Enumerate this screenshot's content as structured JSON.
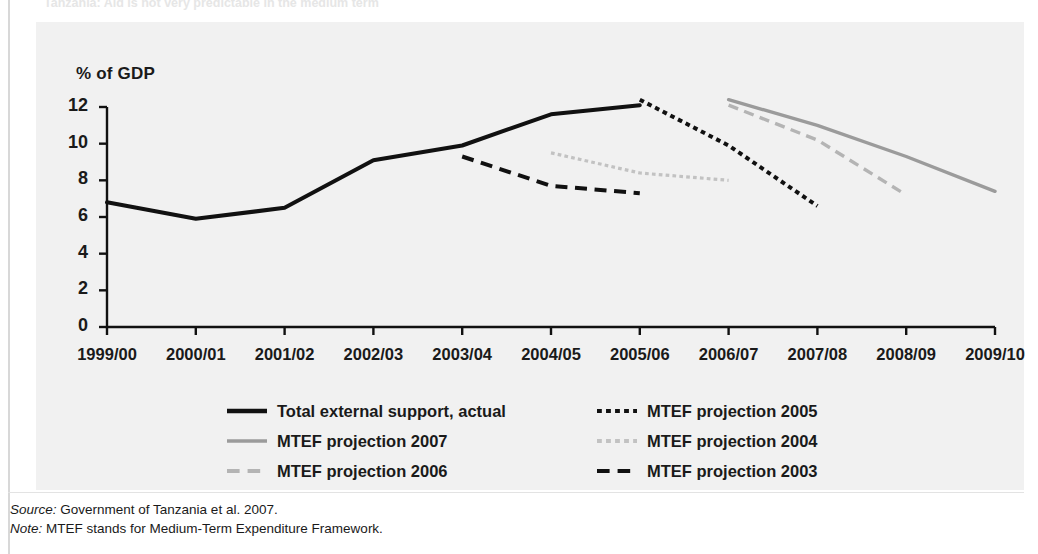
{
  "figure": {
    "clipped_heading": "Tanzania: Aid is not very predictable in the medium term",
    "source_label": "Source:",
    "source_text": " Government of Tanzania et al. 2007.",
    "note_label": "Note:",
    "note_text": " MTEF stands for Medium-Term Expenditure Framework."
  },
  "colors": {
    "panel_background": "#f1f1f1",
    "actual_black": "#111111",
    "mtef2005_black_dotted": "#111111",
    "mtef2003_black_dashed": "#111111",
    "mtef2007_gray_solid": "#9b9b9b",
    "mtef2006_gray_dashed": "#b4b4b4",
    "mtef2004_gray_dotted": "#c2c2c2",
    "axis": "#111111"
  },
  "chart_data": {
    "type": "line",
    "title": "",
    "ylabel": "% of GDP",
    "xlabel": "",
    "ylim": [
      0,
      12
    ],
    "yticks": [
      0,
      2,
      4,
      6,
      8,
      10,
      12
    ],
    "ytick_labels": [
      "0",
      "2",
      "4",
      "6",
      "8",
      "10",
      "12"
    ],
    "grid": false,
    "legend_position": "bottom",
    "categories": [
      "1999/00",
      "2000/01",
      "2001/02",
      "2002/03",
      "2003/04",
      "2004/05",
      "2005/06",
      "2006/07",
      "2007/08",
      "2008/09",
      "2009/10"
    ],
    "series": [
      {
        "name": "Total external support, actual",
        "style": "solid",
        "color": "#111111",
        "width": 4,
        "points": [
          {
            "x": "1999/00",
            "y": 6.8
          },
          {
            "x": "2000/01",
            "y": 5.9
          },
          {
            "x": "2001/02",
            "y": 6.5
          },
          {
            "x": "2002/03",
            "y": 9.1
          },
          {
            "x": "2003/04",
            "y": 9.9
          },
          {
            "x": "2004/05",
            "y": 11.6
          },
          {
            "x": "2005/06",
            "y": 12.1
          }
        ]
      },
      {
        "name": "MTEF projection 2007",
        "style": "solid",
        "color": "#9b9b9b",
        "width": 3.4,
        "points": [
          {
            "x": "2006/07",
            "y": 12.4
          },
          {
            "x": "2007/08",
            "y": 11.0
          },
          {
            "x": "2008/09",
            "y": 9.3
          },
          {
            "x": "2009/10",
            "y": 7.4
          }
        ]
      },
      {
        "name": "MTEF projection 2006",
        "style": "dashed",
        "color": "#b4b4b4",
        "width": 3.4,
        "points": [
          {
            "x": "2006/07",
            "y": 12.1
          },
          {
            "x": "2007/08",
            "y": 10.2
          },
          {
            "x": "2008/09",
            "y": 7.2
          }
        ]
      },
      {
        "name": "MTEF projection 2005",
        "style": "dotted",
        "color": "#111111",
        "width": 4,
        "points": [
          {
            "x": "2005/06",
            "y": 12.4
          },
          {
            "x": "2006/07",
            "y": 9.9
          },
          {
            "x": "2007/08",
            "y": 6.6
          }
        ]
      },
      {
        "name": "MTEF projection 2004",
        "style": "dotted",
        "color": "#c2c2c2",
        "width": 3.2,
        "points": [
          {
            "x": "2004/05",
            "y": 9.5
          },
          {
            "x": "2005/06",
            "y": 8.4
          },
          {
            "x": "2006/07",
            "y": 8.0
          }
        ]
      },
      {
        "name": "MTEF projection 2003",
        "style": "dashed",
        "color": "#111111",
        "width": 4,
        "points": [
          {
            "x": "2003/04",
            "y": 9.3
          },
          {
            "x": "2004/05",
            "y": 7.7
          },
          {
            "x": "2005/06",
            "y": 7.3
          }
        ]
      }
    ],
    "legend": [
      {
        "label": "Total external support, actual",
        "style": "solid",
        "color": "#111111",
        "col": 0,
        "row": 0
      },
      {
        "label": "MTEF projection 2007",
        "style": "solid",
        "color": "#9b9b9b",
        "col": 0,
        "row": 1
      },
      {
        "label": "MTEF projection 2006",
        "style": "dashed",
        "color": "#b4b4b4",
        "col": 0,
        "row": 2
      },
      {
        "label": "MTEF projection 2005",
        "style": "dotted",
        "color": "#111111",
        "col": 1,
        "row": 0
      },
      {
        "label": "MTEF projection 2004",
        "style": "dotted",
        "color": "#c2c2c2",
        "col": 1,
        "row": 1
      },
      {
        "label": "MTEF projection 2003",
        "style": "dashed",
        "color": "#111111",
        "col": 1,
        "row": 2
      }
    ]
  }
}
